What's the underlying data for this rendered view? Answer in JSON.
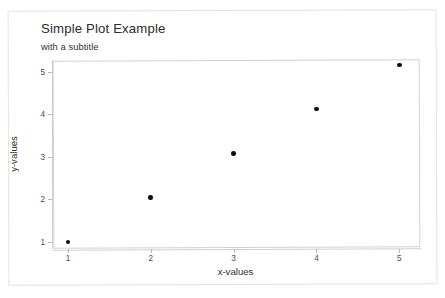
{
  "chart_data": {
    "type": "scatter",
    "title": "Simple Plot Example",
    "subtitle": "with a subtitle",
    "xlabel": "x-values",
    "ylabel": "y-values",
    "x": [
      1,
      2,
      3,
      4,
      5
    ],
    "y": [
      1.0,
      2.05,
      3.08,
      4.12,
      5.15
    ],
    "points": [
      {
        "x": 1,
        "y": 1.0
      },
      {
        "x": 2,
        "y": 2.05
      },
      {
        "x": 3,
        "y": 3.08
      },
      {
        "x": 4,
        "y": 4.12
      },
      {
        "x": 5,
        "y": 5.15
      }
    ],
    "xticks": [
      1,
      2,
      3,
      4,
      5
    ],
    "yticks": [
      1,
      2,
      3,
      4,
      5
    ],
    "xtick_labels": [
      "1",
      "2",
      "3",
      "4",
      "5"
    ],
    "ytick_labels": [
      "1",
      "2",
      "3",
      "4",
      "5"
    ],
    "xlim": [
      0.82,
      5.25
    ],
    "ylim": [
      0.86,
      5.27
    ],
    "grid": false,
    "legend": null,
    "marker": "filled-circle",
    "marker_color": "#0d0d0d",
    "frame_color": "#d2d2d2",
    "background_color": "#ffffff",
    "text_color": "#2b2b2b"
  }
}
